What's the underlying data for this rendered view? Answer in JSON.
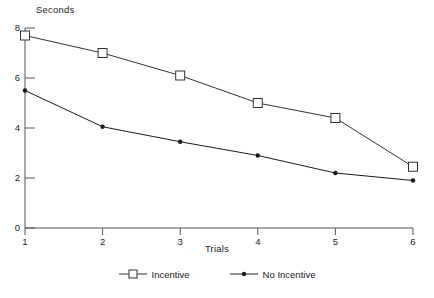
{
  "chart_data": {
    "type": "line",
    "title": "",
    "xlabel": "Trials",
    "ylabel": "Seconds",
    "categories": [
      "1",
      "2",
      "3",
      "4",
      "5",
      "6"
    ],
    "x": [
      1,
      2,
      3,
      4,
      5,
      6
    ],
    "xlim": [
      1,
      6
    ],
    "ylim": [
      0,
      8
    ],
    "y_ticks": [
      "0",
      "2",
      "4",
      "6",
      "8"
    ],
    "y_tick_values": [
      0,
      2,
      4,
      6,
      8
    ],
    "x_ticks": [
      "1",
      "2",
      "3",
      "4",
      "5",
      "6"
    ],
    "grid": false,
    "legend_position": "bottom-center",
    "series": [
      {
        "name": "Incentive",
        "marker": "open-square",
        "color": "#333333",
        "values": [
          7.7,
          7.0,
          6.1,
          5.0,
          4.4,
          2.45
        ]
      },
      {
        "name": "No Incentive",
        "marker": "filled-dot",
        "color": "#1a1a1a",
        "values": [
          5.5,
          4.05,
          3.45,
          2.9,
          2.2,
          1.9
        ]
      }
    ]
  },
  "legend": {
    "entries": [
      {
        "label": "Incentive"
      },
      {
        "label": "No Incentive"
      }
    ]
  },
  "colors": {
    "background": "#ffffff",
    "axis": "#555555",
    "ink": "#1a1a1a"
  }
}
